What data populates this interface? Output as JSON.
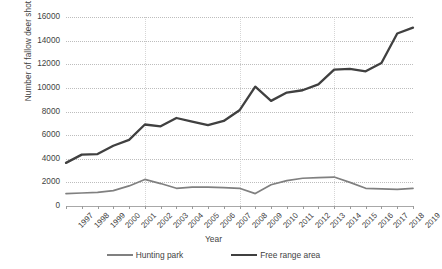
{
  "chart_data": {
    "type": "line",
    "title": "",
    "xlabel": "Year",
    "ylabel": "Number of fallow deer shot",
    "ylim": [
      0,
      16000
    ],
    "ystep": 2000,
    "ytick_labels": [
      "16000",
      "14000",
      "12000",
      "10000",
      "8000",
      "6000",
      "4000",
      "2000",
      "0"
    ],
    "grid": true,
    "legend_position": "bottom",
    "categories": [
      "1997",
      "1998",
      "1999",
      "2000",
      "2001",
      "2002",
      "2003",
      "2004",
      "2005",
      "2006",
      "2007",
      "2008",
      "2009",
      "2010",
      "2011",
      "2012",
      "2013",
      "2014",
      "2015",
      "2016",
      "2017",
      "2018",
      "2019"
    ],
    "series": [
      {
        "name": "Hunting park",
        "color": "#808080",
        "values": [
          1050,
          1100,
          1150,
          1300,
          1700,
          2250,
          1900,
          1500,
          1600,
          1600,
          1550,
          1500,
          1050,
          1800,
          2150,
          2350,
          2400,
          2450,
          2000,
          1500,
          1450,
          1400,
          1500
        ]
      },
      {
        "name": "Free range area",
        "color": "#404040",
        "values": [
          3650,
          4350,
          4400,
          5100,
          5600,
          6900,
          6750,
          7450,
          7150,
          6850,
          7200,
          8100,
          10100,
          8900,
          9600,
          9800,
          10300,
          11550,
          11600,
          11400,
          12100,
          14600,
          15100
        ]
      }
    ]
  },
  "legend": {
    "items": [
      {
        "label": "Hunting park"
      },
      {
        "label": "Free range area"
      }
    ]
  }
}
